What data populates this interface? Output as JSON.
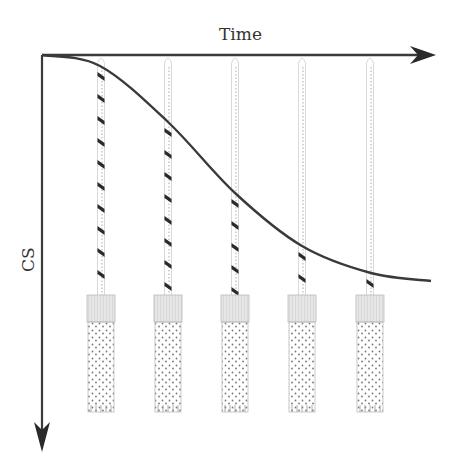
{
  "axes": {
    "x_label": "Time",
    "y_label": "CS",
    "origin": [
      42,
      55
    ],
    "x_end": [
      436,
      55
    ],
    "y_end": [
      42,
      452
    ],
    "color": "#3a3a3a"
  },
  "curve": {
    "description": "Decreasing sigmoid-like curve of CS versus time",
    "points": [
      [
        42,
        55
      ],
      [
        100,
        66
      ],
      [
        168,
        122
      ],
      [
        235,
        193
      ],
      [
        302,
        246
      ],
      [
        371,
        273
      ],
      [
        431,
        281
      ]
    ],
    "color": "#3a3a3a"
  },
  "columns": [
    {
      "x": 101,
      "crossing_y": 66
    },
    {
      "x": 168,
      "crossing_y": 122
    },
    {
      "x": 235,
      "crossing_y": 193
    },
    {
      "x": 302,
      "crossing_y": 246
    },
    {
      "x": 370,
      "crossing_y": 273
    }
  ],
  "tube": {
    "top_y": 295,
    "cap_bottom_y": 322,
    "bottom_y": 412,
    "width": 28,
    "cap_color": "#e2e2e2",
    "dot_color": "#777777"
  },
  "chart_data": {
    "type": "line",
    "title": "",
    "xlabel": "Time",
    "ylabel": "CS",
    "note": "Y axis points downward (CS increases downward); curve shows a decreasing sigmoid-like trend",
    "x": [
      0,
      1,
      2,
      3,
      4,
      5,
      6.8
    ],
    "values": [
      0,
      0.03,
      0.17,
      0.35,
      0.48,
      0.55,
      0.57
    ],
    "sample_points": 5
  }
}
